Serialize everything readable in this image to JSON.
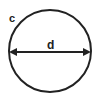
{
  "diagram": {
    "labels": {
      "circumference": "c",
      "diameter": "d"
    },
    "colors": {
      "stroke": "#222222",
      "background": "#ffffff"
    }
  }
}
